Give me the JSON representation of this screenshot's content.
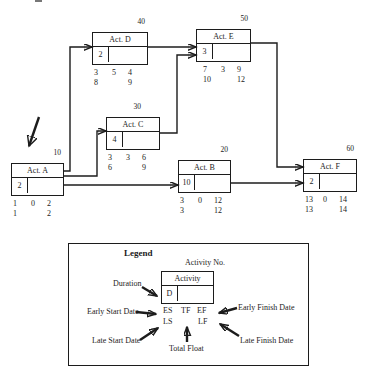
{
  "activities": [
    {
      "id": "A",
      "label": "Act. A",
      "number": "10",
      "duration": "2",
      "es": "1",
      "tf": "0",
      "ef": "2",
      "ls": "1",
      "lf": "2"
    },
    {
      "id": "B",
      "label": "Act. B",
      "number": "20",
      "duration": "10",
      "es": "3",
      "tf": "0",
      "ef": "12",
      "ls": "3",
      "lf": "12"
    },
    {
      "id": "C",
      "label": "Act. C",
      "number": "30",
      "duration": "4",
      "es": "3",
      "tf": "3",
      "ef": "6",
      "ls": "6",
      "lf": "9"
    },
    {
      "id": "D",
      "label": "Act. D",
      "number": "40",
      "duration": "2",
      "es": "3",
      "tf": "5",
      "ef": "4",
      "ls": "8",
      "lf": "9"
    },
    {
      "id": "E",
      "label": "Act. E",
      "number": "50",
      "duration": "3",
      "es": "7",
      "tf": "3",
      "ef": "9",
      "ls": "10",
      "lf": "12"
    },
    {
      "id": "F",
      "label": "Act. F",
      "number": "60",
      "duration": "2",
      "es": "13",
      "tf": "0",
      "ef": "14",
      "ls": "13",
      "lf": "14"
    }
  ],
  "network": {
    "edges": [
      {
        "from": "A",
        "to": "D"
      },
      {
        "from": "A",
        "to": "C"
      },
      {
        "from": "A",
        "to": "B"
      },
      {
        "from": "D",
        "to": "E"
      },
      {
        "from": "C",
        "to": "E"
      },
      {
        "from": "E",
        "to": "F"
      },
      {
        "from": "B",
        "to": "F"
      }
    ],
    "start_marker_target": "A"
  },
  "legend": {
    "title": "Legend",
    "activity_no_label": "Activity No.",
    "activity_label": "Activity",
    "duration_letter": "D",
    "duration_label": "Duration",
    "es": "ES",
    "tf": "TF",
    "ef": "EF",
    "ls": "LS",
    "lf": "LF",
    "early_start_label": "Early Start Date",
    "early_finish_label": "Early Finish Date",
    "late_start_label": "Late Start Date",
    "late_finish_label": "Late Finish Date",
    "total_float_label": "Total Float"
  },
  "colors": {
    "ink": "#1c1c1c",
    "background": "#ffffff"
  }
}
